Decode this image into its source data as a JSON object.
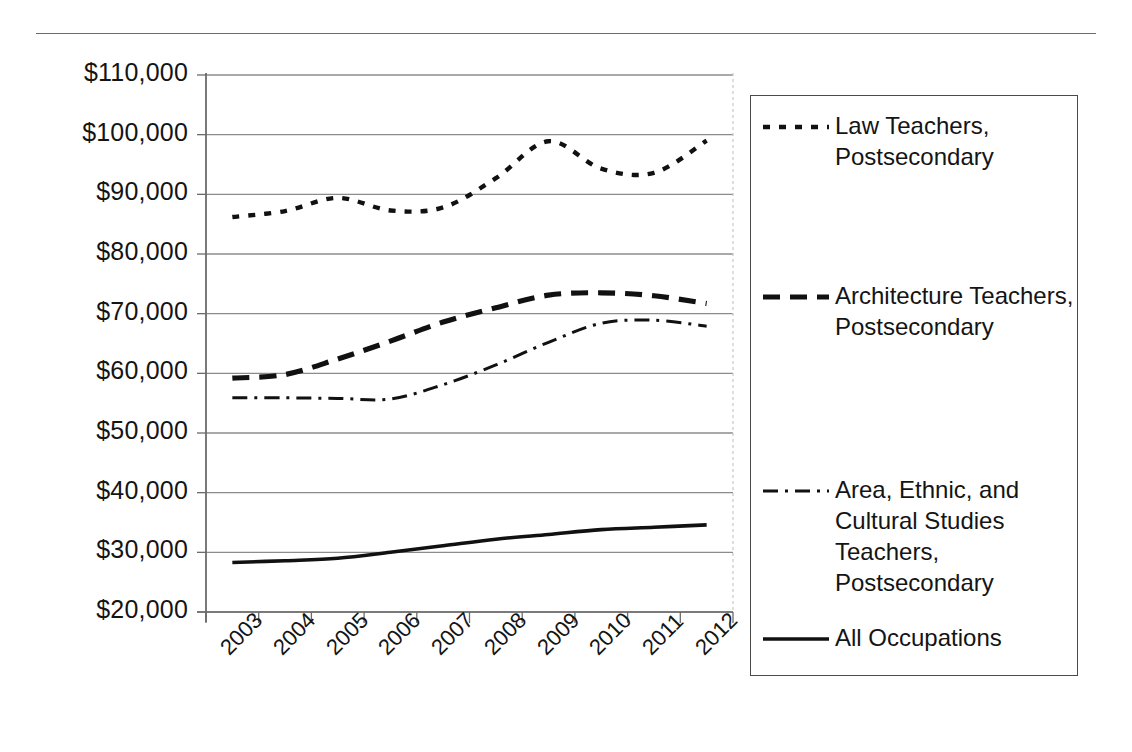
{
  "chart_data": {
    "type": "line",
    "title": "",
    "xlabel": "",
    "ylabel": "",
    "x": [
      "2003",
      "2004",
      "2005",
      "2006",
      "2007",
      "2008",
      "2009",
      "2010",
      "2011",
      "2012"
    ],
    "categories": [
      "2003",
      "2004",
      "2005",
      "2006",
      "2007",
      "2008",
      "2009",
      "2010",
      "2011",
      "2012"
    ],
    "ylim": [
      20000,
      110000
    ],
    "ytick_labels": [
      "$110,000",
      "$100,000",
      "$90,000",
      "$80,000",
      "$70,000",
      "$60,000",
      "$50,000",
      "$40,000",
      "$30,000",
      "$20,000"
    ],
    "ytick_values": [
      110000,
      100000,
      90000,
      80000,
      70000,
      60000,
      50000,
      40000,
      30000,
      20000
    ],
    "grid": "horizontal",
    "legend_position": "right",
    "series": [
      {
        "name": "Law Teachers, Postsecondary",
        "style": "dotted",
        "values": [
          86200,
          87200,
          89400,
          87300,
          87800,
          92700,
          98900,
          94300,
          93600,
          99000
        ]
      },
      {
        "name": "Architecture Teachers, Postsecondary",
        "style": "dashed",
        "values": [
          59200,
          59800,
          62400,
          65400,
          68600,
          71000,
          73100,
          73500,
          73000,
          71700
        ]
      },
      {
        "name": "Area, Ethnic, and Cultural Studies Teachers, Postsecondary",
        "style": "dash-dot",
        "values": [
          55900,
          55900,
          55800,
          55700,
          58100,
          61400,
          65200,
          68400,
          68900,
          67900
        ]
      },
      {
        "name": "All Occupations",
        "style": "solid",
        "values": [
          28300,
          28600,
          29000,
          30000,
          31100,
          32200,
          33000,
          33800,
          34200,
          34600
        ]
      }
    ]
  },
  "legend": {
    "entries": [
      {
        "label": "Law Teachers,\nPostsecondary",
        "style": "dotted"
      },
      {
        "label": "Architecture Teachers,\nPostsecondary",
        "style": "dashed"
      },
      {
        "label": "Area, Ethnic, and\nCultural Studies\nTeachers,\nPostsecondary",
        "style": "dash-dot"
      },
      {
        "label": "All Occupations",
        "style": "solid"
      }
    ]
  }
}
